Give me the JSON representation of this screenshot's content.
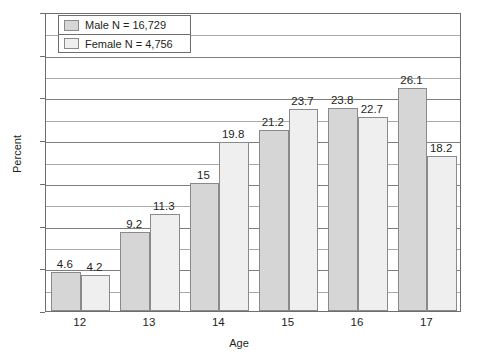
{
  "chart_data": {
    "type": "bar",
    "title": "",
    "xlabel": "Age",
    "ylabel": "Percent",
    "categories": [
      "12",
      "13",
      "14",
      "15",
      "16",
      "17"
    ],
    "series": [
      {
        "name": "Male N = 16,729",
        "color": "#d6d6d6",
        "values": [
          4.6,
          9.2,
          15,
          21.2,
          23.8,
          26.1
        ],
        "labels": [
          "4.6",
          "9.2",
          "15",
          "21.2",
          "23.8",
          "26.1"
        ]
      },
      {
        "name": "Female N = 4,756",
        "color": "#efefef",
        "values": [
          4.2,
          11.3,
          19.8,
          23.7,
          22.7,
          18.2
        ],
        "labels": [
          "4.2",
          "11.3",
          "19.8",
          "23.7",
          "22.7",
          "18.2"
        ]
      }
    ],
    "ylim": [
      0,
      35
    ],
    "y_major_ticks": [
      "0",
      "5",
      "10",
      "15",
      "20",
      "25",
      "30",
      "35"
    ],
    "y_major_values": [
      0,
      5,
      10,
      15,
      20,
      25,
      30,
      35
    ],
    "y_minor_values": [
      2.5,
      7.5,
      12.5,
      17.5,
      22.5,
      27.5,
      32.5
    ],
    "grid": true,
    "legend_position": "top-left"
  },
  "legend": {
    "entries": [
      {
        "label": "Male N = 16,729"
      },
      {
        "label": "Female N = 4,756"
      }
    ]
  },
  "axes": {
    "y_title": "Percent",
    "x_title": "Age"
  }
}
